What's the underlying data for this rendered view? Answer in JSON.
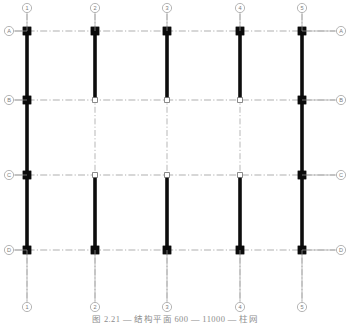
{
  "drawing": {
    "title": "Structural frame elevation grid",
    "caption": "图 2.21  — 结构平面 600 — 11000 — 柱网",
    "canvas": {
      "width": 350,
      "height": 325
    },
    "colors": {
      "member": "#0b0b0b",
      "grid_line": "#9a9a9a",
      "bubble_stroke": "#9d9d9d",
      "bubble_text": "#7c7c7c",
      "background": "#ffffff"
    },
    "line_styles": {
      "grid": "dash-dot-chain",
      "member": "solid-thick"
    }
  },
  "columns": [
    {
      "label": "1",
      "x": 27
    },
    {
      "label": "2",
      "x": 95
    },
    {
      "label": "3",
      "x": 167
    },
    {
      "label": "4",
      "x": 240
    },
    {
      "label": "5",
      "x": 302
    }
  ],
  "rows": [
    {
      "label": "A",
      "y": 31
    },
    {
      "label": "B",
      "y": 100
    },
    {
      "label": "C",
      "y": 175
    },
    {
      "label": "D",
      "y": 250
    }
  ],
  "bubbles": {
    "top": {
      "y": 8,
      "labels": [
        "1",
        "2",
        "3",
        "4",
        "5"
      ]
    },
    "bottom": {
      "y": 307,
      "labels": [
        "1",
        "2",
        "3",
        "4",
        "5"
      ]
    },
    "left": {
      "x": 9,
      "labels": [
        "A",
        "B",
        "C",
        "D"
      ]
    },
    "right": {
      "x": 341,
      "labels": [
        "A",
        "B",
        "C",
        "D"
      ]
    }
  },
  "members": [
    {
      "column": "1",
      "from_row": "A",
      "to_row": "B",
      "type": "column-thick"
    },
    {
      "column": "1",
      "from_row": "B",
      "to_row": "C",
      "type": "column-thick"
    },
    {
      "column": "1",
      "from_row": "C",
      "to_row": "D",
      "type": "column-thick"
    },
    {
      "column": "2",
      "from_row": "A",
      "to_row": "B",
      "type": "column-thick"
    },
    {
      "column": "2",
      "from_row": "C",
      "to_row": "D",
      "type": "column-thick"
    },
    {
      "column": "3",
      "from_row": "A",
      "to_row": "B",
      "type": "column-thick"
    },
    {
      "column": "3",
      "from_row": "C",
      "to_row": "D",
      "type": "column-thick"
    },
    {
      "column": "4",
      "from_row": "A",
      "to_row": "B",
      "type": "column-thick"
    },
    {
      "column": "4",
      "from_row": "C",
      "to_row": "D",
      "type": "column-thick"
    },
    {
      "column": "5",
      "from_row": "A",
      "to_row": "B",
      "type": "column-thick"
    },
    {
      "column": "5",
      "from_row": "B",
      "to_row": "C",
      "type": "column-thick"
    },
    {
      "column": "5",
      "from_row": "C",
      "to_row": "D",
      "type": "column-thick"
    }
  ],
  "nodes": [
    {
      "column": "1",
      "row": "A",
      "style": "filled"
    },
    {
      "column": "2",
      "row": "A",
      "style": "filled"
    },
    {
      "column": "3",
      "row": "A",
      "style": "filled"
    },
    {
      "column": "4",
      "row": "A",
      "style": "filled"
    },
    {
      "column": "5",
      "row": "A",
      "style": "filled"
    },
    {
      "column": "1",
      "row": "B",
      "style": "filled"
    },
    {
      "column": "2",
      "row": "B",
      "style": "hollow"
    },
    {
      "column": "3",
      "row": "B",
      "style": "hollow"
    },
    {
      "column": "4",
      "row": "B",
      "style": "hollow"
    },
    {
      "column": "5",
      "row": "B",
      "style": "filled"
    },
    {
      "column": "1",
      "row": "C",
      "style": "filled"
    },
    {
      "column": "2",
      "row": "C",
      "style": "hollow"
    },
    {
      "column": "3",
      "row": "C",
      "style": "hollow"
    },
    {
      "column": "4",
      "row": "C",
      "style": "hollow"
    },
    {
      "column": "5",
      "row": "C",
      "style": "filled"
    },
    {
      "column": "1",
      "row": "D",
      "style": "filled"
    },
    {
      "column": "2",
      "row": "D",
      "style": "filled"
    },
    {
      "column": "3",
      "row": "D",
      "style": "filled"
    },
    {
      "column": "4",
      "row": "D",
      "style": "filled"
    },
    {
      "column": "5",
      "row": "D",
      "style": "filled"
    }
  ]
}
